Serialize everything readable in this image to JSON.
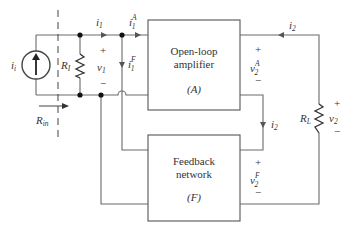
{
  "diagram": {
    "type": "feedback-amplifier-circuit",
    "blocks": {
      "amplifier": {
        "line1": "Open-loop",
        "line2": "amplifier",
        "symbol": "(A)"
      },
      "feedback": {
        "line1": "Feedback",
        "line2": "network",
        "symbol": "(F)"
      }
    },
    "source": {
      "label": "i",
      "sub": "i"
    },
    "resistors": {
      "input": {
        "label": "R",
        "sub": "I"
      },
      "load": {
        "label": "R",
        "sub": "L"
      }
    },
    "input_resistance": {
      "label": "R",
      "sub": "in"
    },
    "currents": {
      "i1": {
        "label": "i",
        "sub": "1"
      },
      "i1A": {
        "label": "i",
        "sub": "1",
        "sup": "A"
      },
      "i1F": {
        "label": "i",
        "sub": "1",
        "sup": "F"
      },
      "i2_top": {
        "label": "i",
        "sub": "2"
      },
      "i2_fb": {
        "label": "i",
        "sub": "2"
      }
    },
    "voltages": {
      "v1": {
        "label": "v",
        "sub": "1",
        "plus": "+",
        "minus": "−"
      },
      "v2A": {
        "label": "v",
        "sub": "2",
        "sup": "A",
        "plus": "+",
        "minus": "−"
      },
      "v2F": {
        "label": "v",
        "sub": "2",
        "sup": "F",
        "plus": "+",
        "minus": "−"
      },
      "v2": {
        "label": "v",
        "sub": "2",
        "plus": "+",
        "minus": "−"
      }
    }
  }
}
